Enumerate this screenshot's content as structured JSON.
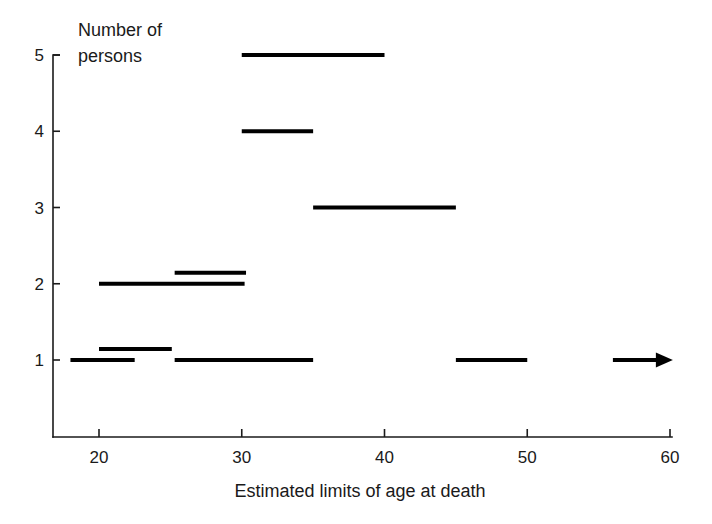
{
  "chart_data": {
    "type": "bar",
    "title": "",
    "subtitle": "",
    "xlabel": "Estimated limits of age at death",
    "ylabel": "Number of persons",
    "ylabel_line1": "Number of",
    "ylabel_line2": "persons",
    "xlim": [
      16.8,
      60.5
    ],
    "ylim": [
      0.45,
      5.35
    ],
    "grid": false,
    "legend": null,
    "orientation": "horizontal-range-bars",
    "xticks": [
      20,
      30,
      40,
      50,
      60
    ],
    "xtick_labels": [
      "20",
      "30",
      "40",
      "50",
      "60"
    ],
    "yticks": [
      1,
      2,
      3,
      4,
      5
    ],
    "ytick_labels": [
      "1",
      "2",
      "3",
      "4",
      "5"
    ],
    "segments": [
      {
        "id": "person-5",
        "y": 5,
        "x_start": 30.0,
        "x_end": 40.0,
        "open_ended": false,
        "row_offset": 0
      },
      {
        "id": "person-4",
        "y": 4,
        "x_start": 30.0,
        "x_end": 35.0,
        "open_ended": false,
        "row_offset": 0
      },
      {
        "id": "person-3",
        "y": 3,
        "x_start": 35.0,
        "x_end": 45.0,
        "open_ended": false,
        "row_offset": 0
      },
      {
        "id": "person-2a",
        "y": 2,
        "x_start": 20.0,
        "x_end": 30.2,
        "open_ended": false,
        "row_offset": 0
      },
      {
        "id": "person-2b",
        "y": 2,
        "x_start": 25.3,
        "x_end": 30.3,
        "open_ended": false,
        "row_offset": 1
      },
      {
        "id": "person-1a",
        "y": 1,
        "x_start": 18.0,
        "x_end": 22.5,
        "open_ended": false,
        "row_offset": 0
      },
      {
        "id": "person-1b",
        "y": 1,
        "x_start": 20.0,
        "x_end": 25.1,
        "open_ended": false,
        "row_offset": 1
      },
      {
        "id": "person-1c",
        "y": 1,
        "x_start": 25.3,
        "x_end": 35.0,
        "open_ended": false,
        "row_offset": 0
      },
      {
        "id": "person-1d",
        "y": 1,
        "x_start": 45.0,
        "x_end": 50.0,
        "open_ended": false,
        "row_offset": 0
      },
      {
        "id": "person-1e",
        "y": 1,
        "x_start": 56.0,
        "x_end": 60.2,
        "open_ended": true,
        "row_offset": 0
      }
    ],
    "colors": {
      "segment": "#000000",
      "axis": "#1a1a1a",
      "background": "#ffffff",
      "text": "#1a1a1a"
    }
  }
}
